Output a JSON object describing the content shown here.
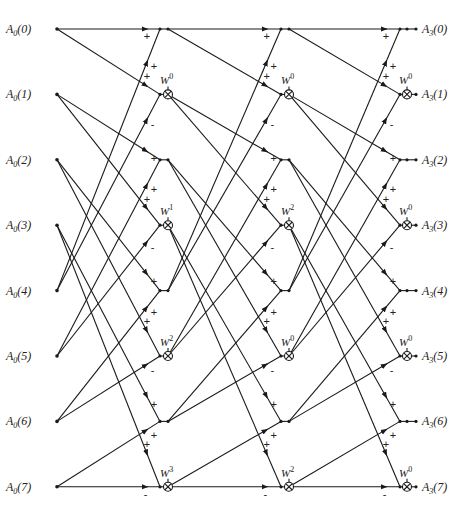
{
  "diagram": {
    "type": "fft-flow-graph",
    "points": 8,
    "stages": 3,
    "inputs": [
      "A_0(0)",
      "A_0(1)",
      "A_0(2)",
      "A_0(3)",
      "A_0(4)",
      "A_0(5)",
      "A_0(6)",
      "A_0(7)"
    ],
    "input_labels": [
      {
        "base": "A",
        "sub": "0",
        "idx": "(0)"
      },
      {
        "base": "A",
        "sub": "0",
        "idx": "(1)"
      },
      {
        "base": "A",
        "sub": "0",
        "idx": "(2)"
      },
      {
        "base": "A",
        "sub": "0",
        "idx": "(3)"
      },
      {
        "base": "A",
        "sub": "0",
        "idx": "(4)"
      },
      {
        "base": "A",
        "sub": "0",
        "idx": "(5)"
      },
      {
        "base": "A",
        "sub": "0",
        "idx": "(6)"
      },
      {
        "base": "A",
        "sub": "0",
        "idx": "(7)"
      }
    ],
    "output_labels": [
      {
        "base": "A",
        "sub": "3",
        "idx": "(0)"
      },
      {
        "base": "A",
        "sub": "3",
        "idx": "(1)"
      },
      {
        "base": "A",
        "sub": "3",
        "idx": "(2)"
      },
      {
        "base": "A",
        "sub": "3",
        "idx": "(3)"
      },
      {
        "base": "A",
        "sub": "3",
        "idx": "(4)"
      },
      {
        "base": "A",
        "sub": "3",
        "idx": "(5)"
      },
      {
        "base": "A",
        "sub": "3",
        "idx": "(6)"
      },
      {
        "base": "A",
        "sub": "3",
        "idx": "(7)"
      }
    ],
    "twiddle_base": "W",
    "twiddle_exponents": [
      [
        0,
        1,
        2,
        3
      ],
      [
        0,
        2,
        0,
        2
      ],
      [
        0,
        0,
        0,
        0
      ]
    ],
    "signs": {
      "sum_node": [
        "+",
        "+"
      ],
      "diff_node": [
        "+",
        "-"
      ]
    },
    "connection_rule": "each stage: inputs i and i+4 -> outputs 2i (sum) and 2i+1 (difference x W^k)",
    "caption": ""
  }
}
